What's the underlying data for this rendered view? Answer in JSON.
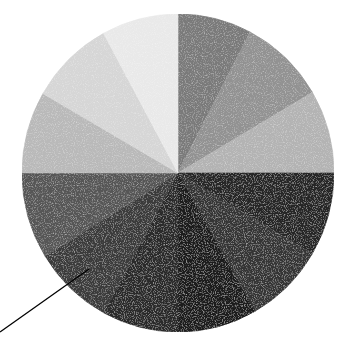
{
  "chart_data": {
    "type": "pie",
    "title": "",
    "legend": [],
    "start_angle_deg": 0,
    "direction": "clockwise",
    "center": [
      178,
      173
    ],
    "radius": [
      156,
      159
    ],
    "slices": [
      {
        "start": 0,
        "end": 27.5,
        "percent": 7.6,
        "color": "#7a7a7a"
      },
      {
        "start": 27.5,
        "end": 59.5,
        "percent": 8.9,
        "color": "#929292"
      },
      {
        "start": 59.5,
        "end": 90,
        "percent": 8.5,
        "color": "#b3b3b3"
      },
      {
        "start": 90,
        "end": 120.5,
        "percent": 8.5,
        "color": "#262626"
      },
      {
        "start": 120.5,
        "end": 150.5,
        "percent": 8.3,
        "color": "#363636"
      },
      {
        "start": 150.5,
        "end": 180,
        "percent": 8.2,
        "color": "#1f1f1f"
      },
      {
        "start": 180,
        "end": 208.5,
        "percent": 7.9,
        "color": "#2c2c2c"
      },
      {
        "start": 208.5,
        "end": 238.5,
        "percent": 8.3,
        "color": "#3b3b3b"
      },
      {
        "start": 238.5,
        "end": 270,
        "percent": 8.8,
        "color": "#565656"
      },
      {
        "start": 270,
        "end": 300,
        "percent": 8.3,
        "color": "#b9b9b9"
      },
      {
        "start": 300,
        "end": 331.5,
        "percent": 8.8,
        "color": "#d6d6d6"
      },
      {
        "start": 331.5,
        "end": 360,
        "percent": 7.9,
        "color": "#e9e9e9"
      }
    ],
    "annotation_line": {
      "x1": 89,
      "y1": 269,
      "x2": 0,
      "y2": 332,
      "color": "#000000"
    }
  }
}
